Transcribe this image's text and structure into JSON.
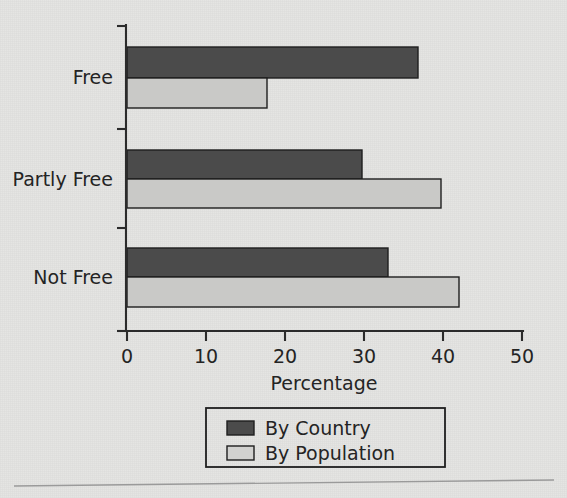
{
  "chart_data": {
    "type": "bar",
    "orientation": "horizontal",
    "title": "",
    "xlabel": "Percentage",
    "ylabel": "",
    "categories": [
      "Free",
      "Partly Free",
      "Not Free"
    ],
    "series": [
      {
        "name": "By Country",
        "color": "#4b4b4b",
        "values": [
          36.8,
          29.8,
          33.0
        ]
      },
      {
        "name": "By Population",
        "color": "#c9c9c7",
        "values": [
          17.7,
          39.7,
          42.0
        ]
      }
    ],
    "xlim": [
      0,
      50
    ],
    "xticks": [
      0,
      10,
      20,
      30,
      40,
      50
    ],
    "xtick_labels": [
      "0",
      "10",
      "20",
      "30",
      "40",
      "50"
    ],
    "grid": false,
    "legend_position": "below-axis-center"
  },
  "axis": {
    "x_title": "Percentage",
    "ticks": [
      "0",
      "10",
      "20",
      "30",
      "40",
      "50"
    ],
    "categories": [
      "Free",
      "Partly Free",
      "Not Free"
    ]
  },
  "legend": {
    "entries": [
      {
        "label": "By Country",
        "swatch": "dark-swatch"
      },
      {
        "label": "By Population",
        "swatch": "light-swatch"
      }
    ]
  },
  "colors": {
    "background": "#e4e4e2",
    "series_dark": "#4b4b4b",
    "series_light": "#c9c9c7",
    "axis": "#2b2b2b",
    "text": "#242424",
    "rule": "#9a9a9a"
  }
}
